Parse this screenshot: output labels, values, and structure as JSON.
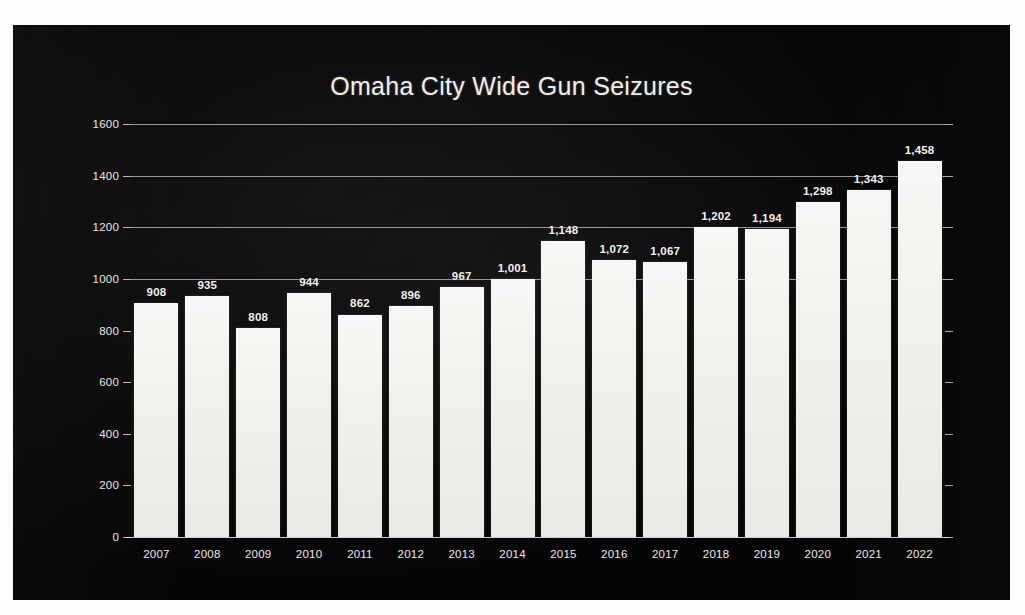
{
  "chart_data": {
    "type": "bar",
    "title": "Omaha City Wide Gun Seizures",
    "xlabel": "",
    "ylabel": "",
    "categories": [
      "2007",
      "2008",
      "2009",
      "2010",
      "2011",
      "2012",
      "2013",
      "2014",
      "2015",
      "2016",
      "2017",
      "2018",
      "2019",
      "2020",
      "2021",
      "2022"
    ],
    "values": [
      908,
      935,
      808,
      944,
      862,
      896,
      967,
      1001,
      1148,
      1072,
      1067,
      1202,
      1194,
      1298,
      1343,
      1458
    ],
    "value_labels": [
      "908",
      "935",
      "808",
      "944",
      "862",
      "896",
      "967",
      "1,001",
      "1,148",
      "1,072",
      "1,067",
      "1,202",
      "1,194",
      "1,298",
      "1,343",
      "1,458"
    ],
    "ylim": [
      0,
      1600
    ],
    "ytick_values": [
      0,
      200,
      400,
      600,
      800,
      1000,
      1200,
      1400,
      1600
    ],
    "ytick_labels": [
      "0",
      "200",
      "400",
      "600",
      "800",
      "1000",
      "1200",
      "1400",
      "1600"
    ],
    "grid": true,
    "gridline_values": [
      1000,
      1200,
      1400,
      1600
    ],
    "legend": null,
    "legend_position": "none",
    "series": [
      {
        "name": "Gun Seizures",
        "values": [
          908,
          935,
          808,
          944,
          862,
          896,
          967,
          1001,
          1148,
          1072,
          1067,
          1202,
          1194,
          1298,
          1343,
          1458
        ]
      }
    ]
  },
  "colors": {
    "slide_background": "#080808",
    "bar_fill": "#f2f2ef",
    "text": "#efeeec",
    "gridline": "#e8e8e8",
    "page_background": "#fdfdfd"
  }
}
